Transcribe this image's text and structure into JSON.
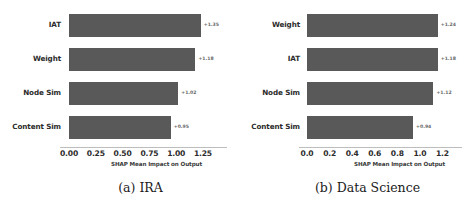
{
  "figure": {
    "subfigures": [
      {
        "caption": "(a) IRA",
        "xlabel": "SHAP Mean Impact on Output",
        "xticks": [
          "0.00",
          "0.25",
          "0.50",
          "0.75",
          "1.00",
          "1.25"
        ],
        "categories": [
          "IAT",
          "Weight",
          "Node Sim",
          "Content Sim"
        ],
        "values": [
          1.35,
          1.18,
          1.02,
          0.95
        ],
        "value_labels": [
          "+1.35",
          "+1.18",
          "+1.02",
          "+0.95"
        ]
      },
      {
        "caption": "(b) Data Science",
        "xlabel": "SHAP Mean Impact on Output",
        "xticks": [
          "0.0",
          "0.2",
          "0.4",
          "0.6",
          "0.8",
          "1.0",
          "1.2"
        ],
        "categories": [
          "Weight",
          "IAT",
          "Node Sim",
          "Content Sim"
        ],
        "values": [
          1.24,
          1.18,
          1.12,
          0.94
        ],
        "value_labels": [
          "+1.24",
          "+1.18",
          "+1.12",
          "+0.94"
        ]
      }
    ]
  },
  "colors": {
    "bar": "#595959",
    "axis": "#bdbdbd",
    "tick_text": "#2b2b2b",
    "value_text": "#6a6a6a"
  },
  "chart_data": [
    {
      "type": "bar",
      "orientation": "horizontal",
      "title": "(a) IRA",
      "categories": [
        "IAT",
        "Weight",
        "Node Sim",
        "Content Sim"
      ],
      "values": [
        1.35,
        1.18,
        1.02,
        0.95
      ],
      "data_labels": [
        "+1.35",
        "+1.18",
        "+1.02",
        "+0.95"
      ],
      "xlabel": "SHAP Mean Impact on Output",
      "ylabel": "",
      "xticks": [
        0.0,
        0.25,
        0.5,
        0.75,
        1.0,
        1.25
      ],
      "xtick_labels": [
        "0.00",
        "0.25",
        "0.50",
        "0.75",
        "1.00",
        "1.25"
      ],
      "xlim": [
        0,
        1.4
      ],
      "grid": false,
      "legend": false,
      "bar_color": "#595959"
    },
    {
      "type": "bar",
      "orientation": "horizontal",
      "title": "(b) Data Science",
      "categories": [
        "Weight",
        "IAT",
        "Node Sim",
        "Content Sim"
      ],
      "values": [
        1.24,
        1.18,
        1.12,
        0.94
      ],
      "data_labels": [
        "+1.24",
        "+1.18",
        "+1.12",
        "+0.94"
      ],
      "xlabel": "SHAP Mean Impact on Output",
      "ylabel": "",
      "xticks": [
        0.0,
        0.2,
        0.4,
        0.6,
        0.8,
        1.0,
        1.2
      ],
      "xtick_labels": [
        "0.0",
        "0.2",
        "0.4",
        "0.6",
        "0.8",
        "1.0",
        "1.2"
      ],
      "xlim": [
        0,
        1.32
      ],
      "grid": false,
      "legend": false,
      "bar_color": "#595959"
    }
  ]
}
